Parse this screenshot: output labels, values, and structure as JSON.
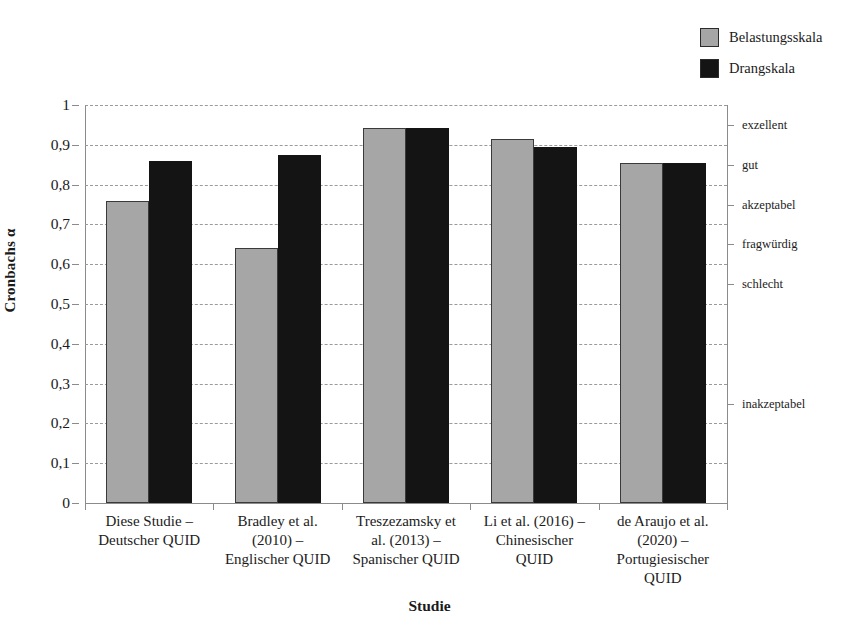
{
  "chart_data": {
    "type": "bar",
    "title": "",
    "xlabel": "Studie",
    "ylabel": "Cronbachs α",
    "ylim": [
      0,
      1
    ],
    "ytick_labels": [
      "1",
      "0,9",
      "0,8",
      "0,7",
      "0,6",
      "0,5",
      "0,4",
      "0,3",
      "0,2",
      "0,1",
      "0"
    ],
    "ytick_values": [
      1,
      0.9,
      0.8,
      0.7,
      0.6,
      0.5,
      0.4,
      0.3,
      0.2,
      0.1,
      0
    ],
    "grid": true,
    "grid_style": "dashed-horizontal",
    "legend_position": "top-right",
    "categories": [
      "Diese Studie – Deutscher QUID",
      "Bradley et al. (2010) – Englischer QUID",
      "Treszezamsky et al. (2013) – Spanischer QUID",
      "Li et al. (2016) – Chinesischer QUID",
      "de Araujo et al. (2020) – Portugiesischer QUID"
    ],
    "category_lines": [
      [
        "Diese Studie –",
        "Deutscher QUID"
      ],
      [
        "Bradley et al.",
        "(2010) –",
        "Englischer QUID"
      ],
      [
        "Treszezamsky et",
        "al. (2013) –",
        "Spanischer QUID"
      ],
      [
        "Li et al. (2016) –",
        "Chinesischer",
        "QUID"
      ],
      [
        "de Araujo et al.",
        "(2020) –",
        "Portugiesischer",
        "QUID"
      ]
    ],
    "series": [
      {
        "name": "Belastungsskala",
        "color": "#a6a6a6",
        "values": [
          0.76,
          0.64,
          0.943,
          0.915,
          0.855
        ]
      },
      {
        "name": "Drangskala",
        "color": "#141414",
        "values": [
          0.86,
          0.875,
          0.942,
          0.895,
          0.855
        ]
      }
    ],
    "secondary_axis": {
      "label": "",
      "ticks": [
        {
          "text": "exzellent",
          "value": 0.95
        },
        {
          "text": "gut",
          "value": 0.85
        },
        {
          "text": "akzeptabel",
          "value": 0.75
        },
        {
          "text": "fragwürdig",
          "value": 0.65
        },
        {
          "text": "schlecht",
          "value": 0.55
        },
        {
          "text": "inakzeptabel",
          "value": 0.25
        }
      ]
    }
  },
  "legend": {
    "items": [
      {
        "label": "Belastungsskala",
        "color": "#a6a6a6"
      },
      {
        "label": "Drangskala",
        "color": "#141414"
      }
    ]
  }
}
